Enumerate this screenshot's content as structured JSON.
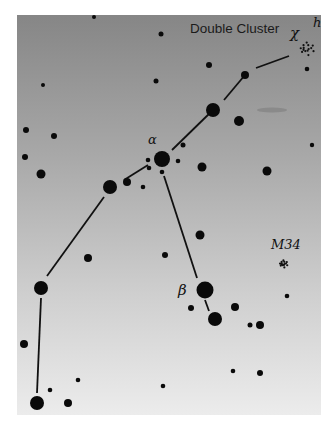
{
  "chart_data": {
    "type": "diagram",
    "labels": {
      "double_cluster": "Double Cluster",
      "chi": "χ",
      "h": "h",
      "alpha": "α",
      "beta": "β",
      "m34": "M34"
    },
    "stars": [
      {
        "x": 94,
        "y": 17,
        "r": 2
      },
      {
        "x": 161,
        "y": 34,
        "r": 2.5
      },
      {
        "x": 43,
        "y": 85,
        "r": 2
      },
      {
        "x": 156,
        "y": 81,
        "r": 2.5
      },
      {
        "x": 209,
        "y": 65,
        "r": 3
      },
      {
        "x": 245,
        "y": 75,
        "r": 4
      },
      {
        "x": 307,
        "y": 69,
        "r": 2.3
      },
      {
        "x": 213,
        "y": 110,
        "r": 7
      },
      {
        "x": 239,
        "y": 121,
        "r": 5
      },
      {
        "x": 26,
        "y": 130,
        "r": 3
      },
      {
        "x": 54,
        "y": 136,
        "r": 3
      },
      {
        "x": 183,
        "y": 145,
        "r": 2.5
      },
      {
        "x": 312,
        "y": 145,
        "r": 2.2
      },
      {
        "x": 25,
        "y": 157,
        "r": 3
      },
      {
        "x": 162,
        "y": 159,
        "r": 8
      },
      {
        "x": 148,
        "y": 160,
        "r": 2.3
      },
      {
        "x": 149,
        "y": 168,
        "r": 2.3
      },
      {
        "x": 178,
        "y": 161,
        "r": 2.3
      },
      {
        "x": 162,
        "y": 172,
        "r": 2.3
      },
      {
        "x": 41,
        "y": 174,
        "r": 4.5
      },
      {
        "x": 202,
        "y": 167,
        "r": 4.5
      },
      {
        "x": 267,
        "y": 171,
        "r": 4.5
      },
      {
        "x": 110,
        "y": 187,
        "r": 7
      },
      {
        "x": 127,
        "y": 182,
        "r": 4
      },
      {
        "x": 143,
        "y": 187,
        "r": 2.3
      },
      {
        "x": 200,
        "y": 235,
        "r": 4.5
      },
      {
        "x": 88,
        "y": 258,
        "r": 4
      },
      {
        "x": 165,
        "y": 255,
        "r": 3
      },
      {
        "x": 41,
        "y": 288,
        "r": 7
      },
      {
        "x": 205,
        "y": 290,
        "r": 8.5
      },
      {
        "x": 287,
        "y": 296,
        "r": 2.3
      },
      {
        "x": 191,
        "y": 308,
        "r": 3
      },
      {
        "x": 235,
        "y": 307,
        "r": 4
      },
      {
        "x": 215,
        "y": 319,
        "r": 7
      },
      {
        "x": 250,
        "y": 325,
        "r": 2.5
      },
      {
        "x": 260,
        "y": 325,
        "r": 4
      },
      {
        "x": 24,
        "y": 344,
        "r": 4
      },
      {
        "x": 78,
        "y": 380,
        "r": 2.3
      },
      {
        "x": 233,
        "y": 371,
        "r": 2.3
      },
      {
        "x": 260,
        "y": 373,
        "r": 3
      },
      {
        "x": 50,
        "y": 390,
        "r": 2.3
      },
      {
        "x": 163,
        "y": 386,
        "r": 2.3
      },
      {
        "x": 68,
        "y": 403,
        "r": 4
      },
      {
        "x": 37,
        "y": 403,
        "r": 7
      }
    ],
    "lines": [
      [
        [
          256,
          68
        ],
        [
          289,
          56
        ]
      ],
      [
        [
          245,
          75
        ],
        [
          224,
          100
        ]
      ],
      [
        [
          213,
          110
        ],
        [
          172,
          150
        ]
      ],
      [
        [
          148,
          165
        ],
        [
          124,
          180
        ]
      ],
      [
        [
          104,
          197
        ],
        [
          47,
          276
        ]
      ],
      [
        [
          164,
          176
        ],
        [
          197,
          278
        ]
      ],
      [
        [
          205,
          300
        ],
        [
          209,
          311
        ]
      ],
      [
        [
          41,
          298
        ],
        [
          37,
          393
        ]
      ]
    ],
    "clusters": [
      {
        "name": "double_cluster",
        "x": 306,
        "y": 49,
        "r": 8
      },
      {
        "name": "m34",
        "x": 283,
        "y": 264,
        "r": 4.5
      }
    ],
    "smudge": {
      "x": 272,
      "y": 110,
      "w": 30,
      "h": 5
    }
  }
}
